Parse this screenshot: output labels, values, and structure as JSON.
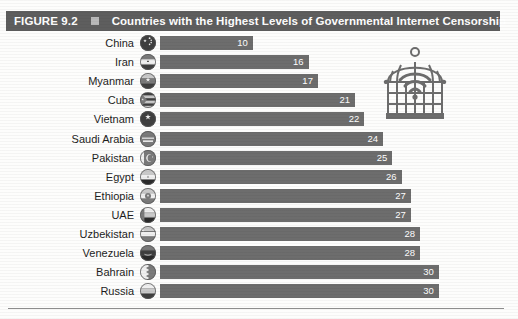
{
  "figure": {
    "number": "FIGURE 9.2",
    "marker_icon": "square-bullet-icon",
    "title": "Countries with the Highest Levels of Governmental Internet Censorship"
  },
  "illustration": {
    "name": "birdcage-with-wifi-icon",
    "color": "#6d6d6d"
  },
  "colors": {
    "header_bar": "#5e5e5e",
    "bar_fill": "#6d6d6d",
    "bar_value_text": "#ffffff",
    "label_text": "#1d1d1d",
    "rule": "#8d8d8d"
  },
  "chart_data": {
    "type": "bar",
    "orientation": "horizontal",
    "title": "Countries with the Highest Levels of Governmental Internet Censorship",
    "xlabel": "",
    "ylabel": "",
    "grid": false,
    "legend": "none",
    "xlim": [
      0,
      31
    ],
    "categories": [
      "China",
      "Iran",
      "Myanmar",
      "Cuba",
      "Vietnam",
      "Saudi Arabia",
      "Pakistan",
      "Egypt",
      "Ethiopia",
      "UAE",
      "Uzbekistan",
      "Venezuela",
      "Bahrain",
      "Russia"
    ],
    "values": [
      10,
      16,
      17,
      21,
      22,
      24,
      25,
      26,
      27,
      27,
      28,
      28,
      30,
      30
    ],
    "data_labels": [
      "10",
      "16",
      "17",
      "21",
      "22",
      "24",
      "25",
      "26",
      "27",
      "27",
      "28",
      "28",
      "30",
      "30"
    ]
  },
  "rows": [
    {
      "country": "China",
      "value_label": "10",
      "flag": "flag-china-icon"
    },
    {
      "country": "Iran",
      "value_label": "16",
      "flag": "flag-iran-icon"
    },
    {
      "country": "Myanmar",
      "value_label": "17",
      "flag": "flag-myanmar-icon"
    },
    {
      "country": "Cuba",
      "value_label": "21",
      "flag": "flag-cuba-icon"
    },
    {
      "country": "Vietnam",
      "value_label": "22",
      "flag": "flag-vietnam-icon"
    },
    {
      "country": "Saudi Arabia",
      "value_label": "24",
      "flag": "flag-saudi-arabia-icon"
    },
    {
      "country": "Pakistan",
      "value_label": "25",
      "flag": "flag-pakistan-icon"
    },
    {
      "country": "Egypt",
      "value_label": "26",
      "flag": "flag-egypt-icon"
    },
    {
      "country": "Ethiopia",
      "value_label": "27",
      "flag": "flag-ethiopia-icon"
    },
    {
      "country": "UAE",
      "value_label": "27",
      "flag": "flag-uae-icon"
    },
    {
      "country": "Uzbekistan",
      "value_label": "28",
      "flag": "flag-uzbekistan-icon"
    },
    {
      "country": "Venezuela",
      "value_label": "28",
      "flag": "flag-venezuela-icon"
    },
    {
      "country": "Bahrain",
      "value_label": "30",
      "flag": "flag-bahrain-icon"
    },
    {
      "country": "Russia",
      "value_label": "30",
      "flag": "flag-russia-icon"
    }
  ]
}
